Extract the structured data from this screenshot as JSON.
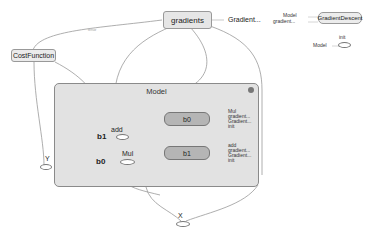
{
  "graph": {
    "nodes": {
      "gradients": {
        "label": "gradients"
      },
      "gradients_out": {
        "label": "Gradient..."
      },
      "gradient_descent": {
        "label": "GradientDescent",
        "inputs": [
          "Model",
          "gradient..."
        ]
      },
      "init": {
        "label": "init",
        "inputs": [
          "Model"
        ]
      },
      "cost_function": {
        "label": "CostFunction"
      },
      "y": {
        "label": "Y"
      },
      "x": {
        "label": "X"
      },
      "model": {
        "label": "Model",
        "nodes": {
          "add": {
            "label": "add"
          },
          "mul": {
            "label": "Mul"
          },
          "b1_input": {
            "label": "b1"
          },
          "b0_input": {
            "label": "b0"
          },
          "b0": {
            "label": "b0",
            "outputs": [
              "Mul",
              "gradient...",
              "Gradient...",
              "init"
            ]
          },
          "b1": {
            "label": "b1",
            "outputs": [
              "add",
              "gradient...",
              "Gradient...",
              "init"
            ]
          }
        }
      }
    },
    "edge_labels": {
      "cost_to_gradients": "tensor",
      "gradients_to_model": "tensor",
      "model_side": "tensor"
    }
  }
}
